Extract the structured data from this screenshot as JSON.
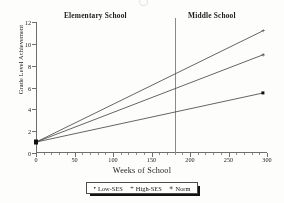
{
  "headings": {
    "elementary": "Elementary School",
    "middle": "Middle School"
  },
  "chart_data": {
    "type": "line",
    "title": "",
    "xlabel": "Weeks of School",
    "ylabel": "Grade Level Achievement",
    "xlim": [
      0,
      300
    ],
    "ylim": [
      0,
      12
    ],
    "xticks": [
      0,
      50,
      100,
      150,
      200,
      250,
      300
    ],
    "xtick_labels": [
      "0",
      "50",
      "100",
      "150",
      "200",
      "250",
      "300"
    ],
    "yticks": [
      0,
      2,
      4,
      6,
      8,
      10,
      12
    ],
    "ytick_labels": [
      "0",
      "2",
      "4",
      "6",
      "8",
      "10",
      "12"
    ],
    "grid": false,
    "legend_position": "bottom",
    "annotations": [
      {
        "name": "phase-divider",
        "type": "vline",
        "x": 180,
        "label": ""
      },
      {
        "name": "elementary-region-label",
        "x": 90,
        "text": "Elementary School"
      },
      {
        "name": "middle-region-label",
        "x": 240,
        "text": "Middle School"
      }
    ],
    "series": [
      {
        "name": "Low-SES",
        "marker": "square-dot",
        "x": [
          0,
          295
        ],
        "values": [
          1.0,
          5.5
        ]
      },
      {
        "name": "High-SES",
        "marker": "plus",
        "x": [
          0,
          295
        ],
        "values": [
          1.0,
          11.2
        ]
      },
      {
        "name": "Norm",
        "marker": "asterisk",
        "x": [
          0,
          295
        ],
        "values": [
          1.0,
          9.0
        ]
      }
    ]
  },
  "legend": {
    "items": [
      {
        "label": "Low-SES",
        "mark": "•"
      },
      {
        "label": "High-SES",
        "mark": "+"
      },
      {
        "label": "Norm",
        "mark": "∗"
      }
    ]
  },
  "colors": {
    "line": "#4a4a4a",
    "axis": "#6e6e6e",
    "divider": "#8a8a8a",
    "text": "#1f1f1f",
    "background": "#fbfbfa"
  }
}
